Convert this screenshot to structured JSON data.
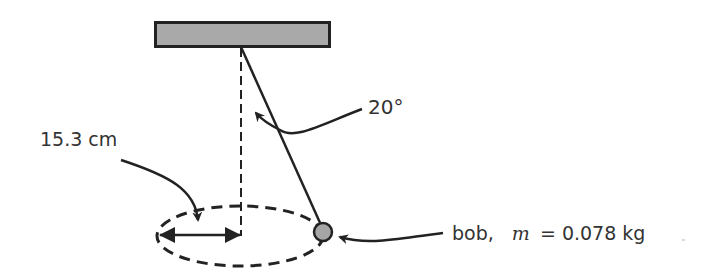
{
  "diagram": {
    "type": "conical-pendulum",
    "labels": {
      "radius": "15.3 cm",
      "angle": "20°",
      "bob_name": "bob,",
      "mass_symbol": "m",
      "mass_value": "= 0.078 kg"
    },
    "colors": {
      "ceiling_fill": "#a9a9a9",
      "bob_fill": "#a6a6a6",
      "stroke": "#222222",
      "text": "#333333"
    },
    "elements": [
      "ceiling-support",
      "string",
      "vertical-axis-dashed",
      "circular-path-dashed",
      "radius-double-arrow",
      "bob"
    ]
  }
}
